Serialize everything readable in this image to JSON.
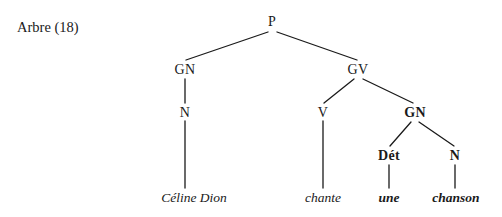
{
  "figure": {
    "caption": "Arbre (18)",
    "background_color": "#ffffff",
    "ink_color": "#1a1a1a",
    "width": 502,
    "height": 217
  },
  "tree": {
    "nodes": {
      "p": {
        "label": "P",
        "x": 272,
        "y": 22,
        "bold": false
      },
      "gn_subject": {
        "label": "GN",
        "x": 185,
        "y": 70,
        "bold": false
      },
      "gv": {
        "label": "GV",
        "x": 358,
        "y": 70,
        "bold": false
      },
      "n_subject": {
        "label": "N",
        "x": 185,
        "y": 113,
        "bold": false
      },
      "v": {
        "label": "V",
        "x": 323,
        "y": 113,
        "bold": false
      },
      "gn_object": {
        "label": "GN",
        "x": 415,
        "y": 113,
        "bold": true
      },
      "det": {
        "label": "Dét",
        "x": 389,
        "y": 156,
        "bold": true
      },
      "n_object": {
        "label": "N",
        "x": 455,
        "y": 156,
        "bold": true
      }
    },
    "terminals": {
      "subject": {
        "text": "Céline Dion",
        "x": 194,
        "y": 198,
        "bold": false
      },
      "verb": {
        "text": "chante",
        "x": 323,
        "y": 198,
        "bold": false
      },
      "determiner": {
        "text": "une",
        "x": 389,
        "y": 198,
        "bold": true
      },
      "object_noun": {
        "text": "chanson",
        "x": 456,
        "y": 198,
        "bold": true
      }
    },
    "edges": [
      {
        "name": "p-to-gn-subject",
        "x1": 268,
        "y1": 32,
        "x2": 186,
        "y2": 60
      },
      {
        "name": "p-to-gv",
        "x1": 277,
        "y1": 32,
        "x2": 357,
        "y2": 60
      },
      {
        "name": "gn-subject-to-n",
        "x1": 185,
        "y1": 79,
        "x2": 185,
        "y2": 103
      },
      {
        "name": "n-to-celine-dion",
        "x1": 185,
        "y1": 121,
        "x2": 185,
        "y2": 188
      },
      {
        "name": "gv-to-v",
        "x1": 354,
        "y1": 79,
        "x2": 324,
        "y2": 103
      },
      {
        "name": "gv-to-gn-object",
        "x1": 363,
        "y1": 79,
        "x2": 413,
        "y2": 103
      },
      {
        "name": "v-to-chante",
        "x1": 323,
        "y1": 121,
        "x2": 323,
        "y2": 188
      },
      {
        "name": "gn-object-to-det",
        "x1": 411,
        "y1": 122,
        "x2": 390,
        "y2": 146
      },
      {
        "name": "gn-object-to-n",
        "x1": 419,
        "y1": 122,
        "x2": 454,
        "y2": 146
      },
      {
        "name": "det-to-une",
        "x1": 389,
        "y1": 165,
        "x2": 389,
        "y2": 188
      },
      {
        "name": "n-object-to-chanson",
        "x1": 455,
        "y1": 165,
        "x2": 455,
        "y2": 188
      }
    ]
  }
}
